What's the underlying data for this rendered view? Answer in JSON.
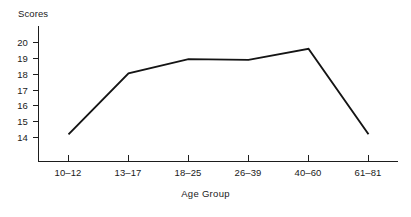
{
  "chart_data": {
    "type": "line",
    "title": "",
    "xlabel": "Age Group",
    "ylabel": "Scores",
    "categories": [
      "10–12",
      "13–17",
      "18–25",
      "26–39",
      "40–60",
      "61–81"
    ],
    "values": [
      14.2,
      18.05,
      18.95,
      18.9,
      19.6,
      14.2
    ],
    "series": [
      {
        "name": "Scores",
        "values": [
          14.2,
          18.05,
          18.95,
          18.9,
          19.6,
          14.2
        ]
      }
    ],
    "ylim": [
      13.6,
      20.5
    ],
    "ytick_labels": [
      "20",
      "19",
      "18",
      "17",
      "16",
      "15",
      "14"
    ],
    "ytick_values": [
      20,
      19,
      18,
      17,
      16,
      15,
      14
    ],
    "grid": false,
    "legend": false,
    "legend_position": "none",
    "line_color": "#141414",
    "axis_color": "#1d1d1d",
    "background_color": "#ffffff",
    "annotations": []
  },
  "axis": {
    "y_title": "Scores",
    "x_title": "Age Group"
  },
  "ticks": {
    "y": [
      {
        "label": "20"
      },
      {
        "label": "19"
      },
      {
        "label": "18"
      },
      {
        "label": "17"
      },
      {
        "label": "16"
      },
      {
        "label": "15"
      },
      {
        "label": "14"
      }
    ],
    "x": [
      {
        "label": "10–12"
      },
      {
        "label": "13–17"
      },
      {
        "label": "18–25"
      },
      {
        "label": "26–39"
      },
      {
        "label": "40–60"
      },
      {
        "label": "61–81"
      }
    ]
  }
}
